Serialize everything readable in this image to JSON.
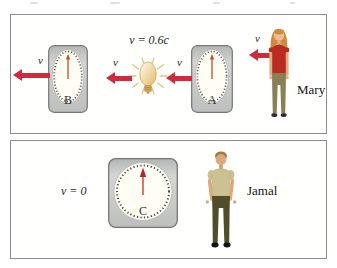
{
  "colors": {
    "arrow": "#cf2b3a",
    "needle": "#c45022",
    "needle_head": "#b8242a",
    "panel-border": "#8c8c8c",
    "clock-body": "#c7c9c7",
    "clock-face": "#fffdf4",
    "bulb-gold": "#e2bb66"
  },
  "top_panel": {
    "bulb_speed": "v = 0.6c",
    "clock_b_label": "B",
    "clock_a_label": "A",
    "arrow_labels": [
      "v",
      "v",
      "v",
      "v"
    ],
    "person_name": "Mary"
  },
  "bottom_panel": {
    "speed": "v = 0",
    "clock_c_label": "C",
    "person_name": "Jamal"
  }
}
